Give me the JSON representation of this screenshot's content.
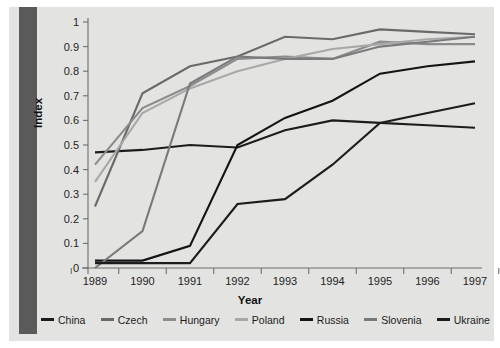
{
  "chart_data": {
    "type": "line",
    "title": "",
    "xlabel": "Year",
    "ylabel": "Index",
    "x": [
      1989,
      1990,
      1991,
      1992,
      1993,
      1994,
      1995,
      1996,
      1997
    ],
    "categories": [
      "1989",
      "1990",
      "1991",
      "1992",
      "1993",
      "1994",
      "1995",
      "1996",
      "1997"
    ],
    "xlim": [
      1988.6,
      1997.4
    ],
    "ylim": [
      0,
      1
    ],
    "yticks": [
      "0",
      "0.1",
      "0.2",
      "0.3",
      "0.4",
      "0.5",
      "0.6",
      "0.7",
      "0.8",
      "0.9",
      "1"
    ],
    "ytick_values": [
      0,
      0.1,
      0.2,
      0.3,
      0.4,
      0.5,
      0.6,
      0.7,
      0.8,
      0.9,
      1
    ],
    "grid": false,
    "legend_position": "bottom",
    "series": [
      {
        "name": "China",
        "color": "#1c1c1c",
        "values": [
          0.47,
          0.48,
          0.5,
          0.49,
          0.56,
          0.6,
          0.59,
          0.58,
          0.57
        ]
      },
      {
        "name": "Czech",
        "color": "#6a6a6a",
        "values": [
          0.25,
          0.71,
          0.82,
          0.86,
          0.94,
          0.93,
          0.97,
          0.96,
          0.95
        ]
      },
      {
        "name": "Hungary",
        "color": "#8c8c8c",
        "values": [
          0.42,
          0.65,
          0.74,
          0.85,
          0.86,
          0.85,
          0.92,
          0.91,
          0.91
        ]
      },
      {
        "name": "Poland",
        "color": "#a8a8a8",
        "values": [
          0.35,
          0.63,
          0.73,
          0.8,
          0.85,
          0.89,
          0.91,
          0.93,
          0.94
        ]
      },
      {
        "name": "Russia",
        "color": "#141414",
        "values": [
          0.03,
          0.03,
          0.09,
          0.5,
          0.61,
          0.68,
          0.79,
          0.82,
          0.84
        ]
      },
      {
        "name": "Slovenia",
        "color": "#7a7a7a",
        "values": [
          0.0,
          0.15,
          0.75,
          0.86,
          0.85,
          0.85,
          0.9,
          0.92,
          0.94
        ]
      },
      {
        "name": "Ukraine",
        "color": "#1c1c1c",
        "values": [
          0.02,
          0.02,
          0.02,
          0.26,
          0.28,
          0.42,
          0.59,
          0.63,
          0.67
        ]
      }
    ]
  },
  "legend": {
    "items": [
      {
        "label": "China",
        "color": "#1c1c1c"
      },
      {
        "label": "Czech",
        "color": "#6a6a6a"
      },
      {
        "label": "Hungary",
        "color": "#8c8c8c"
      },
      {
        "label": "Poland",
        "color": "#a8a8a8"
      },
      {
        "label": "Russia",
        "color": "#141414"
      },
      {
        "label": "Slovenia",
        "color": "#7a7a7a"
      },
      {
        "label": "Ukraine",
        "color": "#1c1c1c"
      }
    ]
  },
  "axes": {
    "x_title": "Year",
    "y_title": "Index"
  }
}
